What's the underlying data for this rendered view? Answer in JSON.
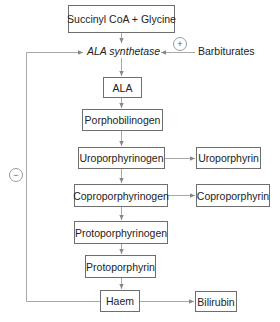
{
  "diagram": {
    "nodes": {
      "succinyl_glycine": "Succinyl CoA + Glycine",
      "ala_synthetase": "ALA synthetase",
      "barbiturates": "Barbiturates",
      "ala": "ALA",
      "porphobilinogen": "Porphobilinogen",
      "uroporphyrinogen": "Uroporphyrinogen",
      "uroporphyrin": "Uroporphyrin",
      "coproporphyrinogen": "Coproporphyrinogen",
      "coproporphyrin": "Coproporphyrin",
      "protoporphyrinogen": "Protoporphyrinogen",
      "protoporphyrin": "Protoporphyrin",
      "haem": "Haem",
      "bilirubin": "Bilirubin"
    },
    "signs": {
      "barbiturates_effect": "+",
      "haem_feedback": "−"
    },
    "edges": [
      {
        "from": "Succinyl CoA + Glycine",
        "to": "ALA synthetase"
      },
      {
        "from": "ALA synthetase",
        "to": "ALA"
      },
      {
        "from": "Barbiturates",
        "to": "ALA synthetase",
        "effect": "+"
      },
      {
        "from": "ALA",
        "to": "Porphobilinogen"
      },
      {
        "from": "Porphobilinogen",
        "to": "Uroporphyrinogen"
      },
      {
        "from": "Uroporphyrinogen",
        "to": "Uroporphyrin"
      },
      {
        "from": "Uroporphyrinogen",
        "to": "Coproporphyrinogen"
      },
      {
        "from": "Coproporphyrinogen",
        "to": "Coproporphyrin"
      },
      {
        "from": "Coproporphyrinogen",
        "to": "Protoporphyrinogen"
      },
      {
        "from": "Protoporphyrinogen",
        "to": "Protoporphyrin"
      },
      {
        "from": "Protoporphyrin",
        "to": "Haem"
      },
      {
        "from": "Haem",
        "to": "Bilirubin"
      },
      {
        "from": "Haem",
        "to": "ALA synthetase",
        "effect": "−"
      }
    ],
    "colors": {
      "box_border": "#6e6e6e",
      "line": "#a0a0a0",
      "text": "#222222"
    }
  }
}
